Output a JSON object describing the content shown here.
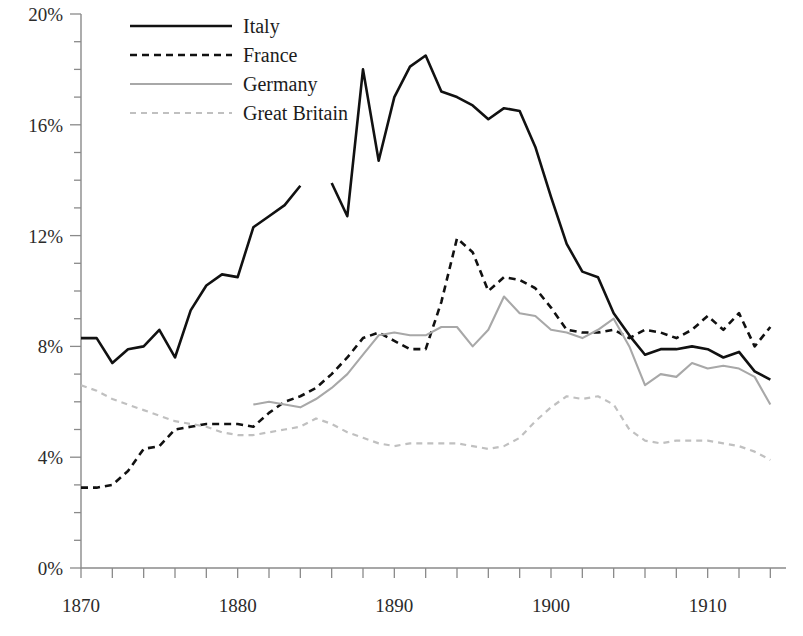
{
  "chart_data": {
    "type": "line",
    "title": "",
    "xlabel": "",
    "ylabel": "",
    "xlim": [
      1870,
      1915
    ],
    "ylim": [
      0,
      20
    ],
    "grid": false,
    "legend_position": "top-left",
    "y_tick_labels": [
      "20%",
      "16%",
      "12%",
      "8%",
      "4%",
      "0%"
    ],
    "y_ticks_major": [
      20,
      16,
      12,
      8,
      4,
      0
    ],
    "y_ticks_minor_step": 1,
    "x_tick_labels": [
      "1870",
      "1880",
      "1890",
      "1900",
      "1910"
    ],
    "x_ticks_major": [
      1870,
      1880,
      1890,
      1900,
      1910
    ],
    "x_ticks_minor_step": 2,
    "series": [
      {
        "name": "Italy",
        "style": "solid",
        "color": "#111111",
        "width": 2.6,
        "x": [
          1870,
          1871,
          1872,
          1873,
          1874,
          1875,
          1876,
          1877,
          1878,
          1879,
          1880,
          1881,
          1882,
          1883,
          1884,
          1886,
          1887,
          1888,
          1889,
          1890,
          1891,
          1892,
          1893,
          1894,
          1895,
          1896,
          1897,
          1898,
          1899,
          1900,
          1901,
          1902,
          1903,
          1904,
          1905,
          1906,
          1907,
          1908,
          1909,
          1910,
          1911,
          1912,
          1913,
          1914
        ],
        "values": [
          8.3,
          8.3,
          7.4,
          7.9,
          8.0,
          8.6,
          7.6,
          9.3,
          10.2,
          10.6,
          10.5,
          12.3,
          12.7,
          13.1,
          13.8,
          13.9,
          12.7,
          18.0,
          14.7,
          17.0,
          18.1,
          18.5,
          17.2,
          17.0,
          16.7,
          16.2,
          16.6,
          16.5,
          15.2,
          13.4,
          11.7,
          10.7,
          10.5,
          9.2,
          8.4,
          7.7,
          7.9,
          7.9,
          8.0,
          7.9,
          7.6,
          7.8,
          7.1,
          6.8
        ],
        "gaps": [
          [
            1884,
            1886
          ]
        ]
      },
      {
        "name": "France",
        "style": "dashed",
        "color": "#111111",
        "width": 2.6,
        "dash": "7,5",
        "x": [
          1870,
          1871,
          1872,
          1873,
          1874,
          1875,
          1876,
          1877,
          1878,
          1879,
          1880,
          1881,
          1882,
          1883,
          1884,
          1885,
          1886,
          1887,
          1888,
          1889,
          1890,
          1891,
          1892,
          1893,
          1894,
          1895,
          1896,
          1897,
          1898,
          1899,
          1900,
          1901,
          1902,
          1903,
          1904,
          1905,
          1906,
          1907,
          1908,
          1909,
          1910,
          1911,
          1912,
          1913,
          1914
        ],
        "values": [
          2.9,
          2.9,
          3.0,
          3.5,
          4.3,
          4.4,
          5.0,
          5.1,
          5.2,
          5.2,
          5.2,
          5.1,
          5.6,
          6.0,
          6.2,
          6.5,
          7.0,
          7.6,
          8.3,
          8.5,
          8.2,
          7.9,
          7.9,
          9.6,
          11.9,
          11.4,
          10.0,
          10.5,
          10.4,
          10.1,
          9.4,
          8.6,
          8.5,
          8.5,
          8.6,
          8.3,
          8.6,
          8.5,
          8.3,
          8.6,
          9.1,
          8.6,
          9.2,
          8.0,
          8.7
        ]
      },
      {
        "name": "Germany",
        "style": "solid",
        "color": "#a8a8a8",
        "width": 2.1,
        "x": [
          1881,
          1882,
          1883,
          1884,
          1885,
          1886,
          1887,
          1888,
          1889,
          1890,
          1891,
          1892,
          1893,
          1894,
          1895,
          1896,
          1897,
          1898,
          1899,
          1900,
          1901,
          1902,
          1903,
          1904,
          1905,
          1906,
          1907,
          1908,
          1909,
          1910,
          1911,
          1912,
          1913,
          1914
        ],
        "values": [
          5.9,
          6.0,
          5.9,
          5.8,
          6.1,
          6.5,
          7.0,
          7.7,
          8.4,
          8.5,
          8.4,
          8.4,
          8.7,
          8.7,
          8.0,
          8.6,
          9.8,
          9.2,
          9.1,
          8.6,
          8.5,
          8.3,
          8.6,
          9.0,
          8.0,
          6.6,
          7.0,
          6.9,
          7.4,
          7.2,
          7.3,
          7.2,
          6.9,
          5.9
        ]
      },
      {
        "name": "Great Britain",
        "style": "dashed",
        "color": "#c0c0c0",
        "width": 2.2,
        "dash": "6,5",
        "x": [
          1870,
          1871,
          1872,
          1873,
          1874,
          1875,
          1876,
          1877,
          1878,
          1879,
          1880,
          1881,
          1882,
          1883,
          1884,
          1885,
          1886,
          1887,
          1888,
          1889,
          1890,
          1891,
          1892,
          1893,
          1894,
          1895,
          1896,
          1897,
          1898,
          1899,
          1900,
          1901,
          1902,
          1903,
          1904,
          1905,
          1906,
          1907,
          1908,
          1909,
          1910,
          1911,
          1912,
          1913,
          1914
        ],
        "values": [
          6.6,
          6.4,
          6.1,
          5.9,
          5.7,
          5.5,
          5.3,
          5.2,
          5.1,
          4.9,
          4.8,
          4.8,
          4.9,
          5.0,
          5.1,
          5.4,
          5.2,
          4.9,
          4.7,
          4.5,
          4.4,
          4.5,
          4.5,
          4.5,
          4.5,
          4.4,
          4.3,
          4.4,
          4.7,
          5.3,
          5.8,
          6.2,
          6.1,
          6.2,
          5.9,
          5.0,
          4.6,
          4.5,
          4.6,
          4.6,
          4.6,
          4.5,
          4.4,
          4.2,
          3.9
        ]
      }
    ]
  },
  "legend": {
    "entries": [
      {
        "label": "Italy"
      },
      {
        "label": "France"
      },
      {
        "label": "Germany"
      },
      {
        "label": "Great Britain"
      }
    ]
  }
}
